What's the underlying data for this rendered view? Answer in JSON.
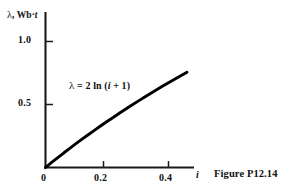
{
  "figure": {
    "caption": "Figure P12.14"
  },
  "axes": {
    "y_title_symbol": "λ",
    "y_title_sep": ", ",
    "y_title_unit_main": "Wb·",
    "y_title_unit_ital": "t",
    "x_title": "i",
    "y_ticks": [
      "1.0",
      "0.5"
    ],
    "x_ticks": [
      "0",
      "0.2",
      "0.4"
    ]
  },
  "annotation": {
    "eq_symbol": "λ",
    "eq_rest_a": " = 2 ln (",
    "eq_var": "i",
    "eq_rest_b": " + 1)"
  },
  "chart_data": {
    "type": "line",
    "title": "",
    "subtitle": "",
    "xlabel": "i",
    "ylabel": "λ, Wb·t",
    "annotations": [
      "λ = 2 ln (i + 1)"
    ],
    "equation": "lambda = 2*ln(i + 1)",
    "grid": false,
    "legend": "none",
    "xlim": [
      0,
      0.48
    ],
    "ylim": [
      0,
      1.16
    ],
    "xticks": [
      0,
      0.2,
      0.4
    ],
    "xticklabels": [
      "0",
      "0.2",
      "0.4"
    ],
    "yticks": [
      0.5,
      1.0
    ],
    "yticklabels": [
      "0.5",
      "1.0"
    ],
    "series": [
      {
        "name": "λ = 2 ln (i + 1)",
        "color": "#000000",
        "x": [
          0.0,
          0.02,
          0.04,
          0.06,
          0.08,
          0.1,
          0.12,
          0.14,
          0.16,
          0.18,
          0.2,
          0.22,
          0.24,
          0.26,
          0.28,
          0.3,
          0.32,
          0.34,
          0.36,
          0.38,
          0.4,
          0.42,
          0.44,
          0.46
        ],
        "y": [
          0.0,
          0.04,
          0.078,
          0.117,
          0.154,
          0.191,
          0.227,
          0.262,
          0.297,
          0.331,
          0.365,
          0.397,
          0.43,
          0.462,
          0.494,
          0.525,
          0.555,
          0.585,
          0.615,
          0.644,
          0.673,
          0.701,
          0.729,
          0.756
        ]
      }
    ]
  },
  "colors": {
    "background": "#ffffff",
    "axis": "#1a1a1a",
    "curve": "#000000",
    "text": "#111111"
  }
}
